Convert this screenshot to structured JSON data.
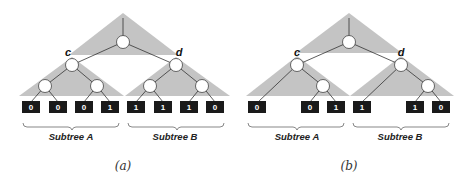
{
  "figure": {
    "panels": [
      {
        "id": "a",
        "caption": "(a)",
        "node_labels": {
          "left": "c",
          "right": "d"
        },
        "leaves": [
          "0",
          "0",
          "0",
          "1",
          "1",
          "1",
          "1",
          "0"
        ],
        "leaf_positions": [
          0,
          1,
          2,
          3,
          4,
          5,
          6,
          7
        ],
        "subtrees": [
          "Subtree A",
          "Subtree B"
        ]
      },
      {
        "id": "b",
        "caption": "(b)",
        "node_labels": {
          "left": "c",
          "right": "d"
        },
        "leaves": [
          "0",
          "0",
          "1",
          "1",
          "1",
          "0"
        ],
        "leaf_positions": [
          0,
          2,
          3,
          4,
          6,
          7
        ],
        "subtrees": [
          "Subtree A",
          "Subtree B"
        ]
      }
    ]
  },
  "colors": {
    "triangle_fill": "#c4c4c4",
    "leaf_box": "#1a1a1a",
    "node_fill": "#ffffff",
    "edge": "#333333"
  }
}
